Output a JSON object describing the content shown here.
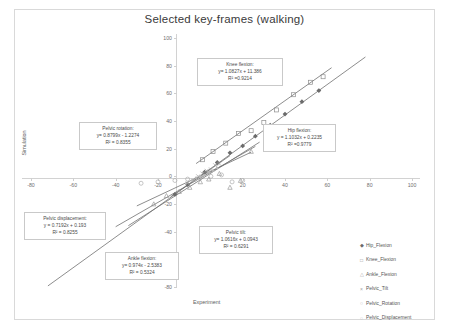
{
  "chart_data": {
    "type": "scatter",
    "title": "Selected key-frames (walking)",
    "xlabel": "Experiment",
    "ylabel": "Simulation",
    "xlim": [
      -80,
      100
    ],
    "ylim": [
      -80,
      100
    ],
    "xticks": [
      "-80",
      "-60",
      "-40",
      "-20",
      "0",
      "20",
      "40",
      "60",
      "80",
      "100"
    ],
    "yticks": [
      "100",
      "80",
      "60",
      "40",
      "20",
      "0",
      "-20",
      "-40",
      "-60",
      "-80"
    ],
    "grid": false,
    "legend_position": "right",
    "series": [
      {
        "name": "Hip_Flexion",
        "marker": "filled-diamond",
        "color": "#6b6b6b",
        "fit": {
          "label": "Hip flexion:",
          "equation": "y = 1.1032x + 0.2235",
          "r2": "R² = 0.9779",
          "slope": 1.1032,
          "intercept": 0.2235
        },
        "points": [
          [
            -12,
            -13
          ],
          [
            -6,
            -6
          ],
          [
            2,
            3
          ],
          [
            8,
            10
          ],
          [
            14,
            17
          ],
          [
            20,
            22
          ],
          [
            26,
            29
          ],
          [
            33,
            37
          ],
          [
            40,
            45
          ],
          [
            48,
            54
          ],
          [
            56,
            62
          ]
        ]
      },
      {
        "name": "Knee_Flexion",
        "marker": "open-square",
        "color": "#8e8e8e",
        "fit": {
          "label": "Knee flexion:",
          "equation": "y = 1.0827x + 11.386",
          "r2": "R² = 0.9214",
          "slope": 1.0827,
          "intercept": 11.386
        },
        "points": [
          [
            1,
            12
          ],
          [
            6,
            18
          ],
          [
            12,
            24
          ],
          [
            18,
            31
          ],
          [
            24,
            33
          ],
          [
            30,
            39
          ],
          [
            36,
            48
          ],
          [
            44,
            59
          ],
          [
            52,
            68
          ],
          [
            58,
            72
          ]
        ]
      },
      {
        "name": "Ankle_Flexion",
        "marker": "open-triangle",
        "color": "#9a9a9a",
        "fit": {
          "label": "Ankle flexion:",
          "equation": "y = 0.974x - 2.5383",
          "r2": "R² = 0.5324",
          "slope": 0.974,
          "intercept": -2.5383
        },
        "points": [
          [
            -22,
            -20
          ],
          [
            -16,
            -14
          ],
          [
            -10,
            -11
          ],
          [
            -5,
            -8
          ],
          [
            0,
            -4
          ],
          [
            4,
            -2
          ],
          [
            9,
            2
          ],
          [
            14,
            -8
          ],
          [
            19,
            -3
          ],
          [
            24,
            18
          ]
        ]
      },
      {
        "name": "Pelvic_Tilt",
        "marker": "cross",
        "color": "#a3a3a3",
        "fit": {
          "label": "Pelvic tilt:",
          "equation": "y = 1.0616x + 0.0943",
          "r2": "R² = 0.6291",
          "slope": 1.0616,
          "intercept": 0.0943
        },
        "points": [
          [
            -6,
            -5
          ],
          [
            -3,
            -3
          ],
          [
            -1,
            0
          ],
          [
            1,
            2
          ],
          [
            3,
            4
          ],
          [
            5,
            5
          ],
          [
            7,
            8
          ],
          [
            9,
            9
          ]
        ]
      },
      {
        "name": "Pelvic_Rotation",
        "marker": "open-circle",
        "color": "#adadad",
        "fit": {
          "label": "Pelvic rotation:",
          "equation": "y = 0.8799x - 1.2274",
          "r2": "R² = 0.8355",
          "slope": 0.8799,
          "intercept": -1.2274
        },
        "points": [
          [
            -28,
            -5
          ],
          [
            -20,
            -4
          ],
          [
            -12,
            -3
          ],
          [
            -6,
            -2
          ],
          [
            0,
            -1
          ],
          [
            5,
            0
          ],
          [
            10,
            1
          ],
          [
            15,
            -4
          ],
          [
            20,
            -3
          ]
        ]
      },
      {
        "name": "Pelvic_Displacement",
        "marker": "small-dot",
        "color": "#b5b5b5",
        "fit": {
          "label": "Pelvic displacement:",
          "equation": "y = 0.7192x + 0.193",
          "r2": "R² = 0.8255",
          "slope": 0.7192,
          "intercept": 0.193
        },
        "points": [
          [
            -4,
            -3
          ],
          [
            -2,
            -1
          ],
          [
            0,
            0
          ],
          [
            2,
            1
          ],
          [
            4,
            3
          ],
          [
            6,
            4
          ],
          [
            8,
            6
          ]
        ]
      }
    ],
    "annotation_boxes": [
      {
        "key": "knee",
        "label": "Knee flexion:",
        "equation": "y= 1.0827x + 11.386",
        "r2": "R² =0.9214"
      },
      {
        "key": "hip",
        "label": "Hip flexion:",
        "equation": "y = 1.1032x + 0.2235",
        "r2": "R² =0.9779"
      },
      {
        "key": "prot",
        "label": "Pelvic rotation:",
        "equation": "y= 0.8799x - 1.2274",
        "r2": "R² = 0.8355"
      },
      {
        "key": "pdisp",
        "label": "Pelvic displacement:",
        "equation": "y = 0.7192x + 0.193",
        "r2": "R² = 0.8255"
      },
      {
        "key": "ankle",
        "label": "Ankle flexion:",
        "equation": "y= 0.974x - 2.5383",
        "r2": "R² = 0.5324"
      },
      {
        "key": "ptilt",
        "label": "Pelvic tilt:",
        "equation": "y= 1.0616x + 0.0943",
        "r2": "R² = 0.6291"
      }
    ]
  }
}
